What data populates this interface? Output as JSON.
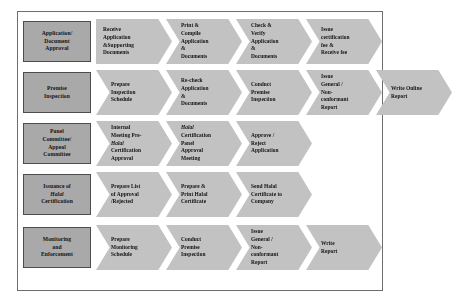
{
  "diagram": {
    "colors": {
      "category_fill": "#a9a9a9",
      "step_fill": "#c2c2c2",
      "border": "#4d4d4d",
      "frame": "#6e6e6e",
      "text": "#111111",
      "background": "#ffffff"
    },
    "rows": [
      {
        "category": [
          "Application/",
          "Document",
          "Approval"
        ],
        "steps": [
          {
            "shape": "pentagon",
            "lines": [
              "Receive",
              "Application",
              "&Supporting",
              "Documents"
            ]
          },
          {
            "shape": "chevron",
            "lines": [
              "Print &",
              "Compile",
              "Application",
              "&",
              "Documents"
            ]
          },
          {
            "shape": "chevron",
            "lines": [
              "Check &",
              "Verify",
              "Application",
              "&",
              "Documents"
            ]
          },
          {
            "shape": "chevron",
            "lines": [
              "Issue",
              "certification",
              "fee &",
              "Receive fee"
            ]
          }
        ]
      },
      {
        "category": [
          "Premise",
          "Inspection"
        ],
        "steps": [
          {
            "shape": "chevron",
            "lines": [
              "Prepare",
              "Inspection",
              "Schedule"
            ]
          },
          {
            "shape": "chevron",
            "lines": [
              "Re-check",
              "Application",
              "&",
              "Documents"
            ]
          },
          {
            "shape": "chevron",
            "lines": [
              "Conduct",
              "Premise",
              "Inspection"
            ]
          },
          {
            "shape": "chevron",
            "lines": [
              "Issue",
              "General /",
              "Non-",
              "conformant",
              "Report"
            ]
          },
          {
            "shape": "chevron",
            "lines": [
              "Write Online",
              "Report"
            ]
          }
        ]
      },
      {
        "category": [
          "Panel",
          "Committee/",
          "Appeal",
          "Committee"
        ],
        "steps": [
          {
            "shape": "chevron",
            "lines": [
              "Internal",
              "Meeting Pre-",
              "Halal",
              "Certification",
              "Approval"
            ],
            "italic_lines": [
              2
            ]
          },
          {
            "shape": "chevron",
            "lines": [
              "Halal",
              "Certification",
              "Panel",
              "Approval",
              "Meeting"
            ],
            "italic_lines": [
              0
            ]
          },
          {
            "shape": "chevron",
            "lines": [
              "Approve /",
              "Reject",
              "Application"
            ]
          }
        ]
      },
      {
        "category": [
          "Issuance of",
          "Halal",
          "Certification"
        ],
        "category_italic_lines": [
          1
        ],
        "steps": [
          {
            "shape": "chevron",
            "lines": [
              "Prepare List",
              "of Approval",
              "/Rejected"
            ]
          },
          {
            "shape": "chevron",
            "lines": [
              "Prepare &",
              "Print Halal",
              "Certificate"
            ]
          },
          {
            "shape": "chevron",
            "lines": [
              "Send Halal",
              "Certificate to",
              "Company"
            ]
          }
        ]
      },
      {
        "category": [
          "Monitoring",
          "and",
          "Enforcement"
        ],
        "steps": [
          {
            "shape": "chevron",
            "lines": [
              "Prepare",
              "Monitoring",
              "Schedule"
            ]
          },
          {
            "shape": "chevron",
            "lines": [
              "Conduct",
              "Premise",
              "Inspection"
            ]
          },
          {
            "shape": "chevron",
            "lines": [
              "Issue",
              "General /",
              "Non-",
              "conformant",
              "Report"
            ]
          },
          {
            "shape": "chevron",
            "lines": [
              "Write",
              "Report"
            ]
          }
        ]
      }
    ]
  }
}
